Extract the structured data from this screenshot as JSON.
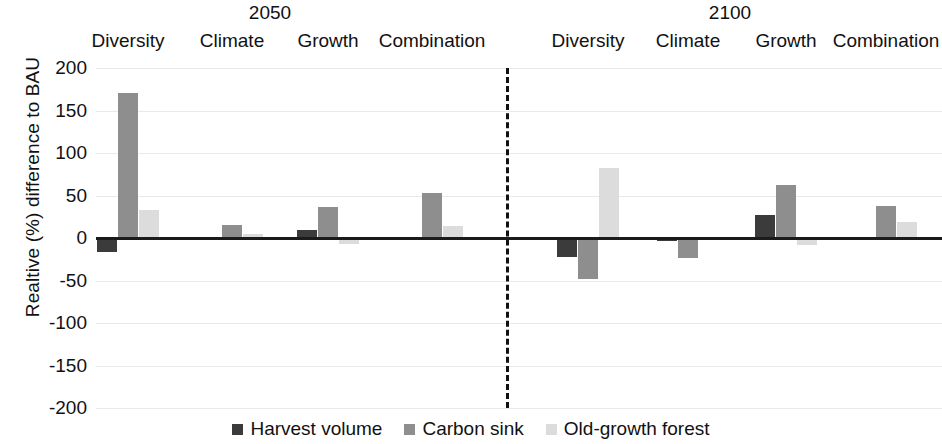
{
  "chart_data": {
    "type": "bar",
    "title": "",
    "xlabel": "",
    "ylabel": "Realtive (%) difference to BAU",
    "ylim": [
      -200,
      200
    ],
    "ytick_step": 50,
    "yticks": [
      "200",
      "150",
      "100",
      "50",
      "0",
      "-50",
      "-100",
      "-150",
      "-200"
    ],
    "grid": true,
    "legend_position": "bottom",
    "panels": [
      {
        "name": "2050"
      },
      {
        "name": "2100"
      }
    ],
    "categories": [
      "Diversity",
      "Climate",
      "Growth",
      "Combination"
    ],
    "series": [
      {
        "name": "Harvest volume",
        "color": "#3b3b3b",
        "values_2050": [
          -16,
          0,
          10,
          0
        ],
        "values_2100": [
          -22,
          -3,
          27,
          1
        ]
      },
      {
        "name": "Carbon sink",
        "color": "#8e8e8e",
        "values_2050": [
          171,
          15,
          36,
          53
        ],
        "values_2100": [
          -48,
          -24,
          62,
          38
        ]
      },
      {
        "name": "Old-growth forest",
        "color": "#dcdcdc",
        "values_2050": [
          33,
          5,
          -7,
          14
        ],
        "values_2100": [
          82,
          0,
          -8,
          19
        ]
      }
    ],
    "legend": [
      {
        "label": "Harvest volume",
        "color": "#3b3b3b"
      },
      {
        "label": "Carbon sink",
        "color": "#8e8e8e"
      },
      {
        "label": "Old-growth forest",
        "color": "#dcdcdc"
      }
    ]
  },
  "panel_titles": {
    "left": "2050",
    "right": "2100"
  },
  "scenario_labels_2050": [
    "Diversity",
    "Climate",
    "Growth",
    "Combination"
  ],
  "scenario_labels_2100": [
    "Diversity",
    "Climate",
    "Growth",
    "Combination"
  ]
}
